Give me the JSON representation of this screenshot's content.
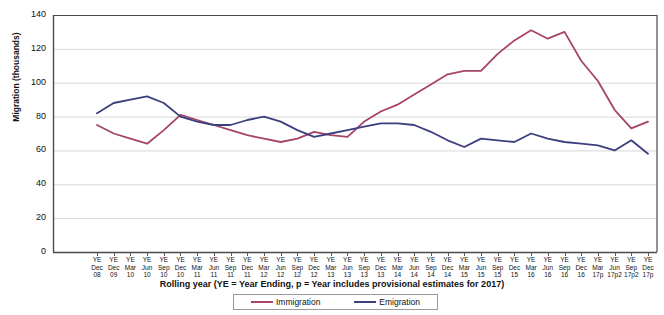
{
  "chart_data": {
    "type": "line",
    "title": "",
    "xlabel": "Rolling year (YE = Year Ending, p = Year includes provisional  estimates for  2017)",
    "ylabel": "Migration (thousands)",
    "ylim": [
      0,
      140
    ],
    "ytick_values": [
      0,
      20,
      40,
      60,
      80,
      100,
      120,
      140
    ],
    "grid": true,
    "legend_position": "bottom",
    "categories": [
      "YE Dec 08",
      "YE Dec 09",
      "YE Mar 10",
      "YE Jun 10",
      "YE Sep 10",
      "YE Dec 10",
      "YE Mar 11",
      "YE Jun 11",
      "YE Sep 11",
      "YE Dec 11",
      "YE Mar 12",
      "YE Jun 12",
      "YE Sep 12",
      "YE Dec 12",
      "YE Mar 13",
      "YE Jun 13",
      "YE Sep 13",
      "YE Dec 13",
      "YE Mar 14",
      "YE Jun 14",
      "YE Sep 14",
      "YE Dec 14",
      "YE Mar 15",
      "YE Jun 15",
      "YE Sep 15",
      "YE Dec 15",
      "YE Mar 16",
      "YE Jun 16",
      "YE Sep 16",
      "YE Dec 16",
      "YE Mar 17p",
      "YE Jun 17p2",
      "YE Sep 17p2",
      "YE Dec 17p"
    ],
    "category_lines": [
      [
        "YE",
        "Dec",
        "08"
      ],
      [
        "YE",
        "Dec",
        "09"
      ],
      [
        "YE",
        "Mar",
        "10"
      ],
      [
        "YE",
        "Jun",
        "10"
      ],
      [
        "YE",
        "Sep",
        "10"
      ],
      [
        "YE",
        "Dec",
        "10"
      ],
      [
        "YE",
        "Mar",
        "11"
      ],
      [
        "YE",
        "Jun",
        "11"
      ],
      [
        "YE",
        "Sep",
        "11"
      ],
      [
        "YE",
        "Dec",
        "11"
      ],
      [
        "YE",
        "Mar",
        "12"
      ],
      [
        "YE",
        "Jun",
        "12"
      ],
      [
        "YE",
        "Sep",
        "12"
      ],
      [
        "YE",
        "Dec",
        "12"
      ],
      [
        "YE",
        "Mar",
        "13"
      ],
      [
        "YE",
        "Jun",
        "13"
      ],
      [
        "YE",
        "Sep",
        "13"
      ],
      [
        "YE",
        "Dec",
        "13"
      ],
      [
        "YE",
        "Mar",
        "14"
      ],
      [
        "YE",
        "Jun",
        "14"
      ],
      [
        "YE",
        "Sep",
        "14"
      ],
      [
        "YE",
        "Dec",
        "14"
      ],
      [
        "YE",
        "Mar",
        "15"
      ],
      [
        "YE",
        "Jun",
        "15"
      ],
      [
        "YE",
        "Sep",
        "15"
      ],
      [
        "YE",
        "Dec",
        "15"
      ],
      [
        "YE",
        "Mar",
        "16"
      ],
      [
        "YE",
        "Jun",
        "16"
      ],
      [
        "YE",
        "Sep",
        "16"
      ],
      [
        "YE",
        "Dec",
        "16"
      ],
      [
        "YE",
        "Mar",
        "17p"
      ],
      [
        "YE",
        "Jun",
        "17p2"
      ],
      [
        "YE",
        "Sep",
        "17p2"
      ],
      [
        "YE",
        "Dec",
        "17p"
      ]
    ],
    "series": [
      {
        "name": "Immigration",
        "color": "#a6436a",
        "values": [
          75,
          70,
          67,
          64,
          72,
          81,
          78,
          75,
          72,
          69,
          67,
          65,
          67,
          71,
          69,
          68,
          77,
          83,
          87,
          93,
          99,
          105,
          107,
          107,
          117,
          125,
          131,
          126,
          130,
          113,
          101,
          84,
          73,
          77
        ]
      },
      {
        "name": "Emigration",
        "color": "#3b3f7e",
        "values": [
          82,
          88,
          90,
          92,
          88,
          80,
          77,
          75,
          75,
          78,
          80,
          77,
          72,
          68,
          70,
          72,
          74,
          76,
          76,
          75,
          71,
          66,
          62,
          67,
          66,
          65,
          70,
          67,
          65,
          64,
          63,
          60,
          66,
          58
        ]
      }
    ]
  },
  "legend": {
    "items": [
      {
        "label": "Immigration",
        "color": "#a6436a"
      },
      {
        "label": "Emigration",
        "color": "#3b3f7e"
      }
    ]
  }
}
